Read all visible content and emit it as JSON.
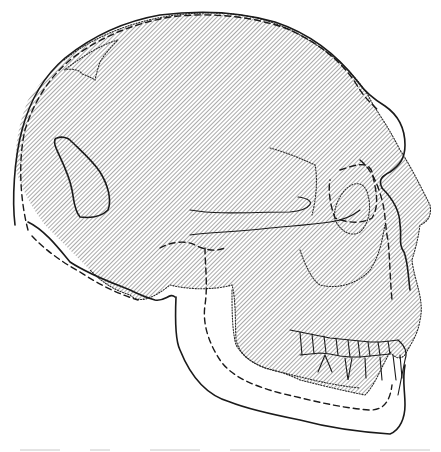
{
  "figure": {
    "view": "right lateral",
    "background": "#ffffff",
    "ink_color": "#1a1a1a",
    "hatch_color": "#8a8a8a",
    "outlines": [
      {
        "style": "solid",
        "description": "Outline of skull A including lower jaw"
      },
      {
        "style": "dashed",
        "description": "Outline of skull B including lower jaw"
      },
      {
        "style": "dotted",
        "description": "Outline of skull C (hatched / shaded area)"
      }
    ],
    "regions": [
      "cranial vault",
      "orbit",
      "nasal aperture",
      "cheek bone",
      "upper dentition",
      "lower dentition",
      "mandible",
      "temporal opening"
    ],
    "caption": ""
  }
}
